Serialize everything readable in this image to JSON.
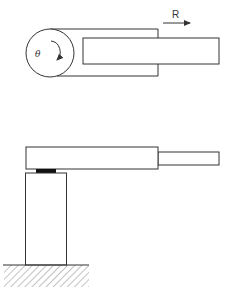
{
  "diagram": {
    "type": "robot-arm-schematic",
    "top_view": {
      "labels": {
        "rotation": "θ",
        "extension": "R"
      },
      "parts": [
        "rotating-base-circle",
        "arm-housing",
        "telescoping-arm",
        "extension-arrow",
        "rotation-arrow"
      ]
    },
    "side_view": {
      "parts": [
        "arm-housing",
        "telescoping-arm",
        "joint-pad",
        "support-column",
        "ground"
      ]
    },
    "colors": {
      "stroke": "#333333",
      "pad": "#111111",
      "hatch": "#888888",
      "background": "#ffffff"
    }
  }
}
